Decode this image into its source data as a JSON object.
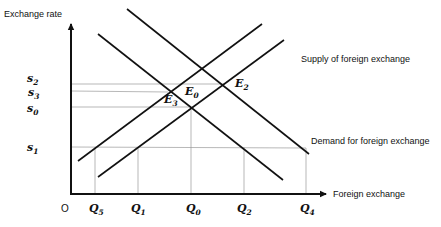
{
  "diagram": {
    "type": "supply-demand",
    "y_axis_label": "Exchange rate",
    "x_axis_label": "Foreign exchange",
    "origin_label": "O",
    "curve_labels": {
      "supply": "Supply of foreign exchange",
      "demand": "Demand for foreign exchange"
    },
    "price_levels": [
      {
        "base": "s",
        "sub": "2"
      },
      {
        "base": "s",
        "sub": "3"
      },
      {
        "base": "s",
        "sub": "0"
      },
      {
        "base": "s",
        "sub": "1"
      }
    ],
    "quantities": [
      {
        "base": "Q",
        "sub": "5"
      },
      {
        "base": "Q",
        "sub": "1"
      },
      {
        "base": "Q",
        "sub": "0"
      },
      {
        "base": "Q",
        "sub": "2"
      },
      {
        "base": "Q",
        "sub": "4"
      }
    ],
    "equilibria": [
      {
        "base": "E",
        "sub": "0"
      },
      {
        "base": "E",
        "sub": "2"
      },
      {
        "base": "E",
        "sub": "3"
      }
    ],
    "colors": {
      "curve": "#111111",
      "guide": "#9a9a9a",
      "background": "#ffffff"
    }
  }
}
